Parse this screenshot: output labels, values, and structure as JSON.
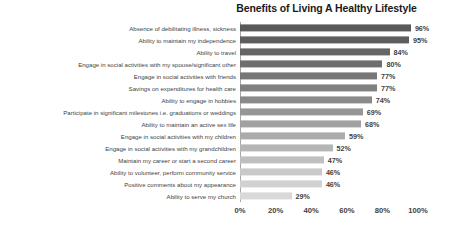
{
  "chart_data": {
    "type": "bar",
    "orientation": "horizontal",
    "title": "Benefits of Living A Healthy Lifestyle",
    "xlabel": "",
    "ylabel": "",
    "xlim": [
      0,
      100
    ],
    "xticks": [
      "0%",
      "20%",
      "40%",
      "60%",
      "80%",
      "100%"
    ],
    "xtick_values": [
      0,
      20,
      40,
      60,
      80,
      100
    ],
    "grid": false,
    "legend": null,
    "value_suffix": "%",
    "categories": [
      "Absence of debilitating illness, sickness",
      "Ability to maintain my independence",
      "Ability to travel",
      "Engage in social activities with my spouse/significant other",
      "Engage in social activities with friends",
      "Savings on expenditures for health care",
      "Ability to engage in hobbies",
      "Participate in significant milestones i.e. graduations or weddings",
      "Ability to maintain an active sex life",
      "Engage in social activities with my children",
      "Engage in social activities with my grandchildren",
      "Maintain my career or start a second career",
      "Ability to volunteer, perform community service",
      "Positive comments about my appearance",
      "Ability to serve my church"
    ],
    "values": [
      96,
      95,
      84,
      80,
      77,
      77,
      74,
      69,
      68,
      59,
      52,
      47,
      46,
      46,
      29
    ],
    "value_labels": [
      "96%",
      "95%",
      "84%",
      "80%",
      "77%",
      "77%",
      "74%",
      "69%",
      "68%",
      "59%",
      "52%",
      "47%",
      "46%",
      "46%",
      "29%"
    ],
    "bar_colors": [
      "#595959",
      "#5e5e5e",
      "#666666",
      "#6e6e6e",
      "#777777",
      "#808080",
      "#8a8a8a",
      "#969696",
      "#a1a1a1",
      "#ababab",
      "#b5b5b5",
      "#bfbfbf",
      "#c9c9c9",
      "#d1d1d1",
      "#d9d9d9"
    ],
    "colors": {
      "background": "#ffffff",
      "title": "#1a1a1a",
      "text": "#3f3f3f",
      "axis_line": "#a6a6a6"
    }
  }
}
